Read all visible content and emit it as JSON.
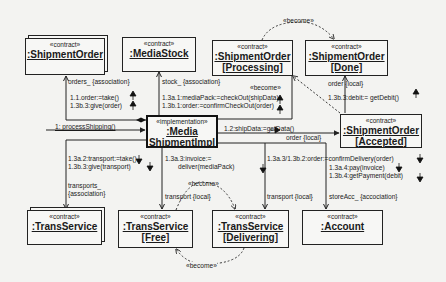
{
  "diagram": {
    "type": "UML collaboration diagram",
    "objects": {
      "shipment_order": {
        "stereotype": "«contract»",
        "name": ":ShipmentOrder",
        "state": ""
      },
      "media_stock": {
        "stereotype": "«contract»",
        "name": ":MediaStock",
        "state": ""
      },
      "shipment_processing": {
        "stereotype": "«contract»",
        "name": ":ShipmentOrder",
        "state": "[Processing]"
      },
      "shipment_done": {
        "stereotype": "«contract»",
        "name": ":ShipmentOrder",
        "state": "[Done]"
      },
      "media_impl": {
        "stereotype": "«implementation»",
        "name1": ":Media",
        "name2": "ShipmentImpl"
      },
      "shipment_accepted": {
        "stereotype": "«contract»",
        "name": ":ShipmentOrder",
        "state": "[Accepted]"
      },
      "trans_service": {
        "stereotype": "«contract»",
        "name": ":TransService",
        "state": ""
      },
      "trans_free": {
        "stereotype": "«contract»",
        "name": ":TransService",
        "state": "[Free]"
      },
      "trans_delivering": {
        "stereotype": "«contract»",
        "name": ":TransService",
        "state": "[Delivering]"
      },
      "account": {
        "stereotype": "«contract»",
        "name": ":Account",
        "state": ""
      }
    },
    "labels": {
      "become_top": "«become»",
      "become_mid": "«become»",
      "become_transport": "«become»",
      "become_bottom": "«become»",
      "orders_assoc": "orders_ {association}",
      "msg_1_1": "1.1.order:=take()",
      "msg_1_3b_3_order": "1.3b.3:give(order)",
      "stock_assoc": "stock_ {association}",
      "msg_1_3a_1": "1.3a.1:mediaPack:=checkOut(shipData)",
      "msg_1_3b_1": "1.3b.1:order:=confirmCheckOut(order)",
      "order_local_done": "order {local}",
      "msg_1_3b_3_debit": "1.3b.3:debit:= getDebit()",
      "msg_1": "1: processShipping()",
      "msg_1_2": "1.2:shipData:=getData()",
      "order_local_accepted": "order {local}",
      "msg_1_3a_2": "1.3a.2:transport:=take()",
      "msg_1_3b_3_transport": "1.3b.3:give(transport)",
      "msg_1_3a_3_invoice_1": "1.3a.3:invoice:=",
      "msg_1_3a_3_invoice_2": "deliver(mediaPack)",
      "msg_confirm": "1.3a.3/1.3b.2:order:=confirmDelivery(order)",
      "msg_pay": "1.3a.4:pay(invoice)",
      "msg_payment": "1.3b.4:getPayment(debit)",
      "transports_assoc_1": "transports_",
      "transports_assoc_2": "{association}",
      "transport_local_free": "transport {local}",
      "transport_local_delivering": "transport {local}",
      "store_acc": "storeAcc_ {accociation}"
    }
  }
}
